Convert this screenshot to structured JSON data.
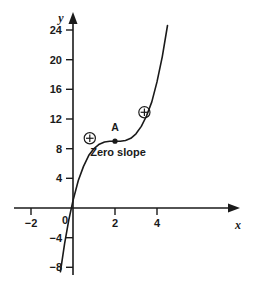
{
  "chart_data": {
    "type": "line",
    "title": "",
    "xlabel": "x",
    "ylabel": "y",
    "xlim": [
      -2.6,
      5.2
    ],
    "ylim": [
      -9.5,
      25.5
    ],
    "grid": false,
    "legend": null,
    "function": "y = (x - 2)^3 + 9",
    "x_ticks": [
      -2,
      0,
      2,
      4
    ],
    "x_tick_labels": [
      "−2",
      "0",
      "2",
      "4"
    ],
    "y_ticks": [
      -8,
      -4,
      4,
      8,
      12,
      16,
      20,
      24
    ],
    "y_tick_labels": [
      "−8",
      "−4",
      "4",
      "8",
      "12",
      "16",
      "20",
      "24"
    ],
    "x": [
      -1.35,
      -1.2,
      -1.0,
      -0.8,
      -0.6,
      -0.4,
      -0.2,
      0.0,
      0.25,
      0.5,
      0.75,
      1.0,
      1.25,
      1.5,
      1.75,
      2.0,
      2.25,
      2.5,
      2.75,
      3.0,
      3.25,
      3.5,
      3.75,
      4.0,
      4.25,
      4.5,
      4.75
    ],
    "y": [
      -30.7,
      -23.0,
      -18.0,
      -12.6,
      -8.6,
      -4.8,
      -1.6,
      1.0,
      3.7,
      5.6,
      7.1,
      8.0,
      8.6,
      8.9,
      9.0,
      9.0,
      9.0,
      9.1,
      9.4,
      10.0,
      11.0,
      12.4,
      14.3,
      17.0,
      20.4,
      24.6,
      29.8
    ],
    "points": [
      {
        "label": "A",
        "x": 2,
        "y": 9,
        "marker": "filled-dot",
        "annotation": "Zero slope"
      }
    ],
    "markers": [
      {
        "type": "circled-plus",
        "x": 0.8,
        "y": 9.4
      },
      {
        "type": "circled-plus",
        "x": 3.4,
        "y": 12.9
      }
    ],
    "annotations": [
      {
        "text": "Zero slope",
        "x": 2.0,
        "y": 7.6
      },
      {
        "text": "A",
        "x": 2.0,
        "y": 10.6
      }
    ]
  },
  "labels": {
    "y_axis_name": "y",
    "x_axis_name": "x",
    "point_a": "A",
    "zero_slope": "Zero slope",
    "tick_24": "24",
    "tick_20": "20",
    "tick_16": "16",
    "tick_12": "12",
    "tick_8": "8",
    "tick_4": "4",
    "tick_0": "0",
    "tick_neg4": "−4",
    "tick_neg8": "−8",
    "tick_x_neg2": "−2",
    "tick_x_2": "2",
    "tick_x_4": "4"
  },
  "colors": {
    "ink": "#1a1a1a",
    "background": "#ffffff"
  }
}
